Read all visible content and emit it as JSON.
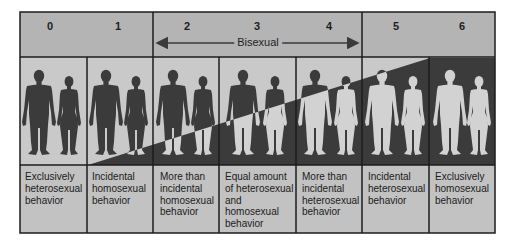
{
  "colors": {
    "header_bg": "#b4b4b4",
    "band_light": "#c9c9c9",
    "band_dark": "#3b3b3b",
    "figure_dark": "#3b3b3b",
    "figure_light": "#d2d2d2",
    "text_bg": "#c2c2c2",
    "border": "#1c1c1c"
  },
  "scale": {
    "ratings": [
      {
        "value": "0",
        "description": "Exclusively\nheterosexual\nbehavior"
      },
      {
        "value": "1",
        "description": "Incidental\nhomosexual\nbehavior"
      },
      {
        "value": "2",
        "description": "More than\nincidental\nhomosexual\nbehavior"
      },
      {
        "value": "3",
        "description": "Equal amount\nof heterosexual\nand\nhomosexual\nbehavior"
      },
      {
        "value": "4",
        "description": "More than\nincidental\nheterosexual\nbehavior"
      },
      {
        "value": "5",
        "description": "Incidental\nheterosexual\nbehavior"
      },
      {
        "value": "6",
        "description": "Exclusively\nhomosexual\nbehavior"
      }
    ],
    "range_label": "Bisexual",
    "range_from": "2",
    "range_to": "4"
  }
}
